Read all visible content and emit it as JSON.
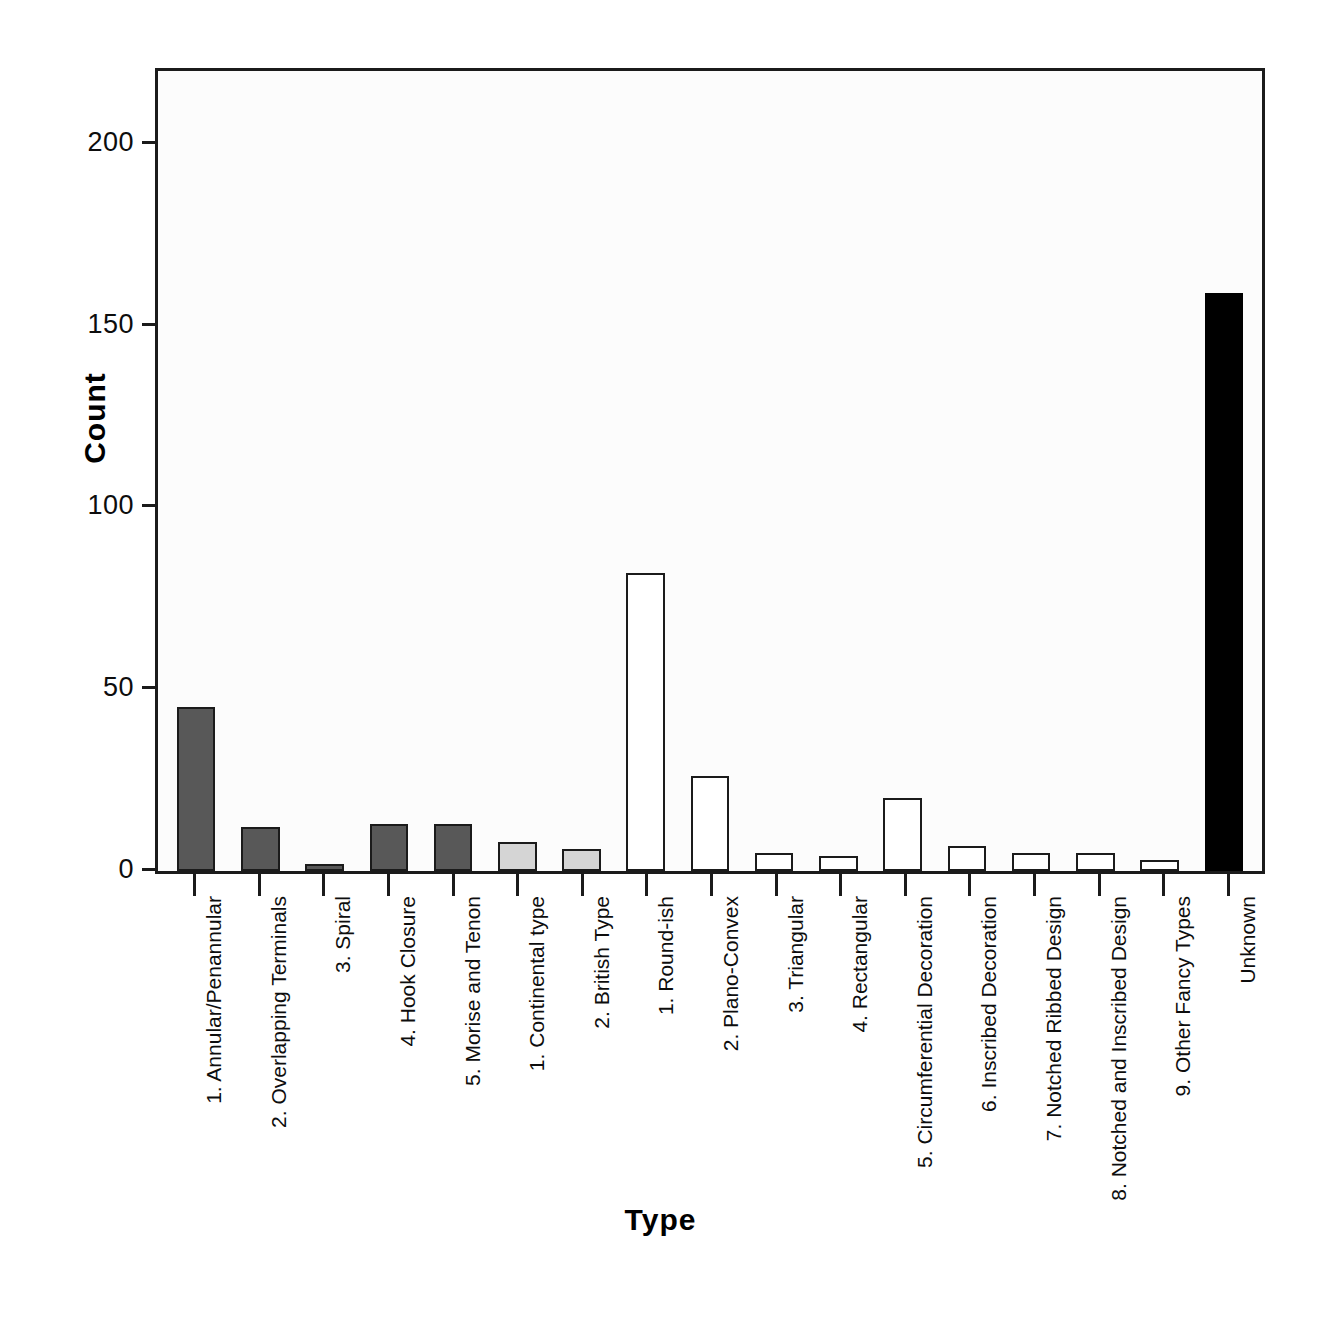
{
  "chart_data": {
    "type": "bar",
    "title": "",
    "xlabel": "Type",
    "ylabel": "Count",
    "ylim": [
      0,
      220
    ],
    "yticks": [
      0,
      50,
      100,
      150,
      200
    ],
    "ytick_labels": [
      "0",
      "50",
      "100",
      "150",
      "200"
    ],
    "grid": false,
    "legend": "none",
    "categories": [
      "1. Annular/Penannular",
      "2. Overlapping Terminals",
      "3. Spiral",
      "4. Hook Closure",
      "5. Morise and Tenon",
      "1. Continental type",
      "2. British Type",
      "1. Round-ish",
      "2. Plano-Convex",
      "3. Triangular",
      "4. Rectangular",
      "5. Circumferential Decoration",
      "6. Inscribed Decoration",
      "7. Notched Ribbed Design",
      "8. Notched and Inscribed Design",
      "9. Other Fancy Types",
      "Unknown"
    ],
    "values": [
      45,
      12,
      2,
      13,
      13,
      8,
      6,
      82,
      26,
      5,
      4,
      20,
      7,
      5,
      5,
      3,
      159
    ],
    "bar_styles": [
      "fill-dark",
      "fill-dark",
      "fill-dark",
      "fill-dark",
      "fill-dark",
      "fill-light",
      "fill-light",
      "fill-white",
      "fill-white",
      "fill-white",
      "fill-white",
      "fill-white",
      "fill-white",
      "fill-white",
      "fill-white",
      "fill-white",
      "fill-black"
    ],
    "colors": {
      "dark_gray": "#585858",
      "light_gray": "#d5d5d5",
      "white": "#ffffff",
      "black": "#000000",
      "axis": "#1b1b1b",
      "plot_background": "#fcfcfc"
    }
  }
}
